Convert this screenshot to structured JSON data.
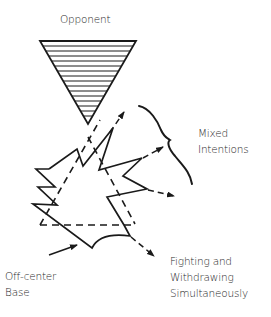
{
  "labels": {
    "opponent": "Opponent",
    "mixed_1": "Mixed",
    "mixed_2": "Intentions",
    "fighting_1": "Fighting and",
    "fighting_2": "Withdrawing",
    "fighting_3": "Simultaneously",
    "base_1": "Off-center",
    "base_2": "Base"
  },
  "colors": {
    "ink": "#1a1a1a",
    "background": "#ffffff"
  }
}
